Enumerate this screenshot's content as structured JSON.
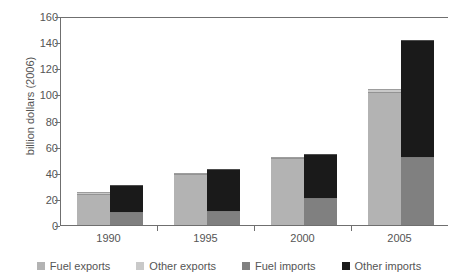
{
  "chart_data": {
    "type": "bar",
    "title": "",
    "subtitle": "",
    "xlabel": "",
    "ylabel": "billion dollars (2006)",
    "categories": [
      "1990",
      "1995",
      "2000",
      "2005"
    ],
    "ylim": [
      0,
      160
    ],
    "yticks": [
      0,
      20,
      40,
      60,
      80,
      100,
      120,
      140,
      160
    ],
    "grid": false,
    "legend_position": "bottom",
    "stacked": true,
    "groups": [
      "exports",
      "imports"
    ],
    "series": [
      {
        "name": "Fuel exports",
        "group": "exports",
        "color": "#b3b3b3",
        "values": [
          24,
          39,
          51,
          102
        ]
      },
      {
        "name": "Other exports",
        "group": "exports",
        "color": "#c9c9c9",
        "values": [
          1,
          1,
          1,
          2
        ]
      },
      {
        "name": "Fuel imports",
        "group": "imports",
        "color": "#808080",
        "values": [
          10,
          11,
          21,
          52
        ]
      },
      {
        "name": "Other imports",
        "group": "imports",
        "color": "#1a1a1a",
        "values": [
          21,
          32,
          33,
          90
        ]
      }
    ],
    "totals": {
      "exports": [
        25,
        40,
        52,
        104
      ],
      "imports": [
        31,
        43,
        54,
        142
      ]
    }
  },
  "axis": {
    "y_title": "billion dollars (2006)",
    "y_tick_labels": [
      "0",
      "20",
      "40",
      "60",
      "80",
      "100",
      "120",
      "140",
      "160"
    ],
    "x_tick_labels": [
      "1990",
      "1995",
      "2000",
      "2005"
    ]
  },
  "legend": {
    "items": [
      {
        "label": "Fuel exports",
        "color": "#b3b3b3"
      },
      {
        "label": "Other exports",
        "color": "#c9c9c9"
      },
      {
        "label": "Fuel imports",
        "color": "#808080"
      },
      {
        "label": "Other imports",
        "color": "#1a1a1a"
      }
    ]
  },
  "colors": {
    "fuel_exports": "#b3b3b3",
    "other_exports": "#c9c9c9",
    "fuel_imports": "#808080",
    "other_imports": "#1a1a1a",
    "axis": "#6f6f6f",
    "text": "#555555",
    "background": "#ffffff"
  }
}
